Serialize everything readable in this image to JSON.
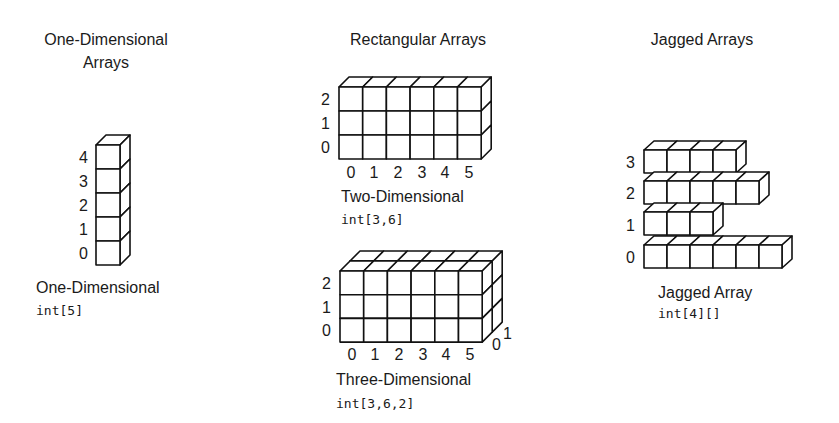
{
  "colors": {
    "stroke": "#111111",
    "fill": "#ffffff",
    "text": "#1a1a1a",
    "background": "#ffffff"
  },
  "sections": {
    "one_dimensional": {
      "title_line1": "One-Dimensional",
      "title_line2": "Arrays",
      "caption": "One-Dimensional",
      "code": "int[5]",
      "row_labels": [
        "4",
        "3",
        "2",
        "1",
        "0"
      ]
    },
    "rectangular": {
      "title": "Rectangular Arrays",
      "two_d": {
        "caption": "Two-Dimensional",
        "code": "int[3,6]",
        "row_labels": [
          "2",
          "1",
          "0"
        ],
        "col_labels": [
          "0",
          "1",
          "2",
          "3",
          "4",
          "5"
        ]
      },
      "three_d": {
        "caption": "Three-Dimensional",
        "code": "int[3,6,2]",
        "row_labels": [
          "2",
          "1",
          "0"
        ],
        "col_labels": [
          "0",
          "1",
          "2",
          "3",
          "4",
          "5"
        ],
        "depth_labels": [
          "0",
          "1"
        ]
      }
    },
    "jagged": {
      "title": "Jagged Arrays",
      "caption": "Jagged Array",
      "code": "int[4][]",
      "row_labels": [
        "3",
        "2",
        "1",
        "0"
      ],
      "row_lengths": [
        4,
        5,
        3,
        6
      ]
    }
  },
  "geometry": {
    "one_d": {
      "x": 96,
      "y": 145,
      "cols": 1,
      "rows": 5,
      "cw": 24,
      "ch": 24,
      "depth": 1,
      "dx": 10,
      "dy": 10
    },
    "two_d": {
      "x": 339,
      "y": 87,
      "cols": 6,
      "rows": 3,
      "cw": 23.7,
      "ch": 24,
      "depth": 1,
      "dx": 10,
      "dy": 10
    },
    "three_d": {
      "x": 340,
      "y": 271,
      "cols": 6,
      "rows": 3,
      "cw": 23.7,
      "ch": 23.7,
      "depth": 2,
      "dx": 10,
      "dy": 10
    },
    "jagged": {
      "x": 644,
      "row_tops": [
        150,
        181,
        212,
        245
      ],
      "cw": 23,
      "ch": 23,
      "dx": 10,
      "dy": 9
    }
  }
}
